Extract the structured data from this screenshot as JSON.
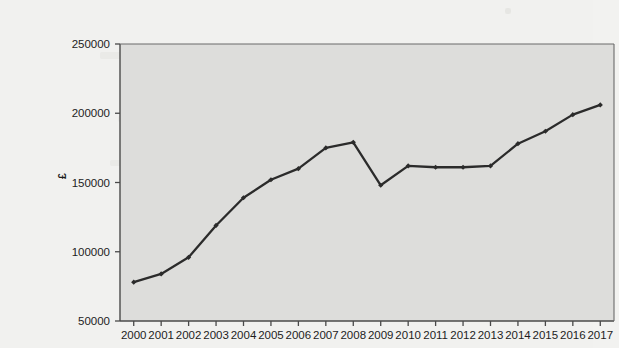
{
  "chart_data": {
    "type": "line",
    "title": "",
    "subtitle": "",
    "xlabel": "",
    "ylabel": "£",
    "categories": [
      "2000",
      "2001",
      "2002",
      "2003",
      "2004",
      "2005",
      "2006",
      "2007",
      "2008",
      "2009",
      "2010",
      "2011",
      "2012",
      "2013",
      "2014",
      "2015",
      "2016",
      "2017"
    ],
    "values": [
      78000,
      84000,
      96000,
      119000,
      139000,
      152000,
      160000,
      175000,
      179000,
      148000,
      162000,
      161000,
      161000,
      162000,
      178000,
      187000,
      199000,
      206000
    ],
    "series": [
      {
        "name": "",
        "values": [
          78000,
          84000,
          96000,
          119000,
          139000,
          152000,
          160000,
          175000,
          179000,
          148000,
          162000,
          161000,
          161000,
          162000,
          178000,
          187000,
          199000,
          206000
        ]
      }
    ],
    "ylim": [
      50000,
      250000
    ],
    "yticks": [
      50000,
      100000,
      150000,
      200000,
      250000
    ],
    "ytick_labels": [
      "50000",
      "100000",
      "150000",
      "200000",
      "250000"
    ],
    "xlim_categories": [
      "2000",
      "2017"
    ],
    "grid": false,
    "legend": "none",
    "marker": "diamond",
    "line_color": "#2b2b2b",
    "plot_background_color": "#dddddb",
    "page_background_color": "#f1f1ef",
    "axis_color": "#4a4a4a"
  },
  "figure": {
    "y_axis_title": "£"
  }
}
